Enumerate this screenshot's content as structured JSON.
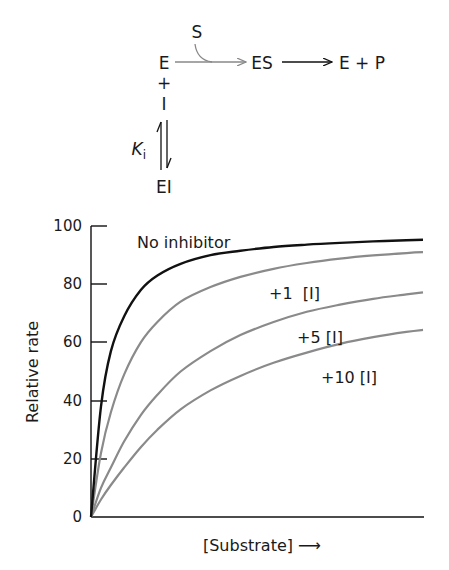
{
  "scheme": {
    "substrate": "S",
    "enzyme": "E",
    "complex": "ES",
    "products": "E + P",
    "plus": "+",
    "inhibitor": "I",
    "constant_main": "K",
    "constant_sub": "i",
    "inhibited_complex": "EI"
  },
  "chart_data": {
    "type": "line",
    "title": "",
    "xlabel": "[Substrate] →",
    "ylabel": "Relative rate",
    "ylim": [
      0,
      100
    ],
    "yticks": [
      0,
      20,
      40,
      60,
      80,
      100
    ],
    "grid": false,
    "x": [
      0,
      0.03,
      0.06,
      0.1,
      0.15,
      0.2,
      0.27,
      0.36,
      0.45,
      0.55,
      0.65,
      0.75,
      0.85,
      0.95,
      1.0
    ],
    "series": [
      {
        "name": "No inhibitor",
        "color": "#111111",
        "values": [
          0,
          38,
          57,
          69,
          78,
          83,
          87,
          90,
          91.5,
          92.8,
          93.6,
          94.2,
          94.7,
          95.1,
          95.3
        ]
      },
      {
        "name": "+1 [I]",
        "color": "#8a8a8a",
        "values": [
          0,
          22,
          36,
          49,
          60,
          67,
          74,
          79,
          82.5,
          85.3,
          87.3,
          88.8,
          89.9,
          90.7,
          91.0
        ]
      },
      {
        "name": "+5 [I]",
        "color": "#8a8a8a",
        "values": [
          0,
          10,
          17,
          26,
          35,
          42,
          50,
          57,
          62.5,
          67,
          70.5,
          73,
          75,
          76.5,
          77.2
        ]
      },
      {
        "name": "+10 [I]",
        "color": "#8a8a8a",
        "values": [
          0,
          6,
          11,
          17,
          24,
          30,
          37,
          43.5,
          48.5,
          53,
          56.5,
          59.5,
          61.8,
          63.6,
          64.3
        ]
      }
    ],
    "annotations": [
      "No inhibitor",
      "+1  [I]",
      "+5 [I]",
      "+10 [I]"
    ]
  },
  "labels": {
    "no_inhibitor": "No inhibitor",
    "plus1": "+1  [I]",
    "plus5": "+5 [I]",
    "plus10": "+10 [I]",
    "y_axis": "Relative rate",
    "x_axis": "[Substrate] ⟶",
    "ticks": [
      "0",
      "20",
      "40",
      "60",
      "80",
      "100"
    ]
  }
}
